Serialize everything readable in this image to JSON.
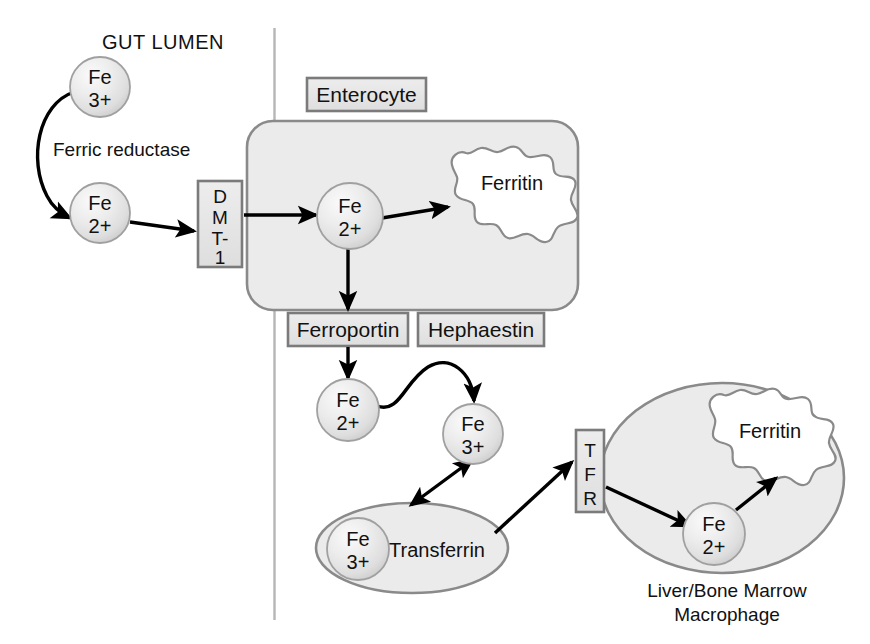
{
  "diagram": {
    "title_region_label": "GUT LUMEN",
    "colors": {
      "cell_fill": "#ebebeb",
      "cell_stroke": "#8a8a8a",
      "box_fill": "#e2e2e2",
      "box_stroke": "#7b7b7b",
      "sphere_light": "#f4f4f4",
      "sphere_mid": "#e3e3e3",
      "sphere_edge": "#c2c2c2",
      "sphere_stroke": "#9a9a9a",
      "arrow": "#000000",
      "membrane_line": "#b4b4b4",
      "text": "#111111"
    },
    "lumen": {
      "heading": "GUT LUMEN",
      "enzyme_label": "Ferric reductase",
      "ferric_ion": {
        "element": "Fe",
        "charge": "3+"
      },
      "ferrous_ion": {
        "element": "Fe",
        "charge": "2+"
      }
    },
    "membrane": {
      "name": "apical-membrane-line"
    },
    "transporters": {
      "dmt1": {
        "label": "DMT-1",
        "letters": [
          "D",
          "M",
          "T-",
          "1"
        ]
      },
      "ferroportin": {
        "label": "Ferroportin"
      },
      "hephaestin": {
        "label": "Hephaestin"
      },
      "tfr": {
        "label": "TFR",
        "letters": [
          "T",
          "F",
          "R"
        ]
      }
    },
    "enterocyte": {
      "label": "Enterocyte",
      "ferritin_label": "Ferritin",
      "ion": {
        "element": "Fe",
        "charge": "2+"
      }
    },
    "basolateral": {
      "ferrous_ion": {
        "element": "Fe",
        "charge": "2+"
      },
      "ferric_ion": {
        "element": "Fe",
        "charge": "3+"
      }
    },
    "transferrin": {
      "label": "Transferrin",
      "ion": {
        "element": "Fe",
        "charge": "3+"
      }
    },
    "macrophage": {
      "caption_line1": "Liver/Bone Marrow",
      "caption_line2": "Macrophage",
      "ferritin_label": "Ferritin",
      "ion": {
        "element": "Fe",
        "charge": "2+"
      }
    }
  }
}
